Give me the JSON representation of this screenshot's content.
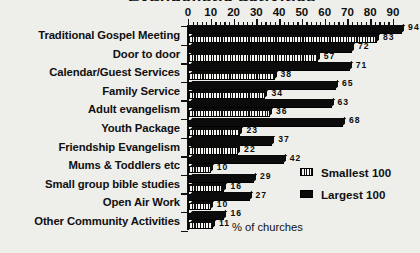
{
  "chart": {
    "title_fragment": "Evangelistic activities",
    "xlabel": "% of churches",
    "legend": {
      "smallest_label": "Smallest 100",
      "largest_label": "Largest 100"
    }
  },
  "chart_data": {
    "type": "bar",
    "orientation": "horizontal",
    "title": "",
    "xlabel": "% of churches",
    "ylabel": "",
    "xlim": [
      0,
      90
    ],
    "xticks": [
      0,
      10,
      20,
      30,
      40,
      50,
      60,
      70,
      80,
      90
    ],
    "minor_tick_step": 2,
    "grid": false,
    "axis_position": "top",
    "legend_position": "middle-right",
    "categories": [
      "Traditional Gospel Meeting",
      "Door to door",
      "Calendar/Guest Services",
      "Family Service",
      "Adult evangelism",
      "Youth Package",
      "Friendship Evangelism",
      "Mums & Toddlers etc",
      "Small group bible studies",
      "Open Air Work",
      "Other Community Activities"
    ],
    "series": [
      {
        "name": "Largest 100",
        "style": "solid-black",
        "values": [
          94,
          72,
          71,
          65,
          63,
          68,
          37,
          42,
          29,
          27,
          16
        ]
      },
      {
        "name": "Smallest 100",
        "style": "vertical-hatch",
        "values": [
          83,
          57,
          38,
          34,
          36,
          23,
          22,
          10,
          16,
          10,
          11
        ]
      }
    ]
  },
  "ticks": [
    {
      "label": "0",
      "value": 0
    },
    {
      "label": "10",
      "value": 10
    },
    {
      "label": "20",
      "value": 20
    },
    {
      "label": "30",
      "value": 30
    },
    {
      "label": "40",
      "value": 40
    },
    {
      "label": "50",
      "value": 50
    },
    {
      "label": "60",
      "value": 60
    },
    {
      "label": "70",
      "value": 70
    },
    {
      "label": "80",
      "value": 80
    },
    {
      "label": "90",
      "value": 90
    }
  ],
  "colors": {
    "background": "#eeeeea",
    "ink": "#101010",
    "bar_large": "#0b0b0b",
    "bar_small_hatch": "#111111"
  }
}
